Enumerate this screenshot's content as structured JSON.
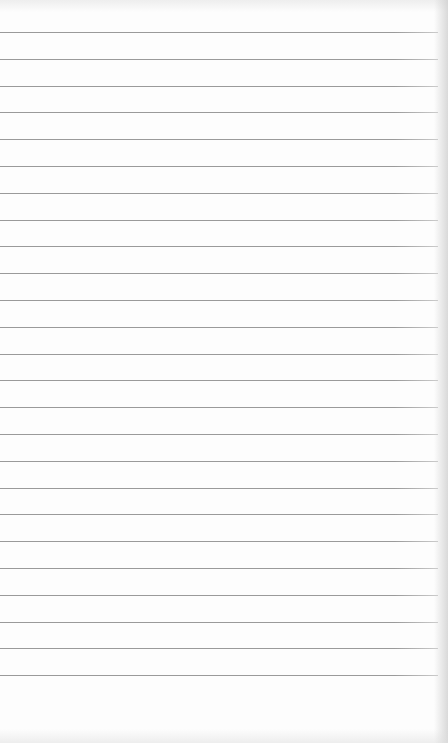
{
  "sheet": {
    "description": "blank ruled paper",
    "background_color": "#fdfdfd",
    "line_color": "#9a9a9a",
    "ruled_lines": {
      "count": 25,
      "first_y": 32,
      "spacing": 26.8,
      "width": 438
    }
  }
}
